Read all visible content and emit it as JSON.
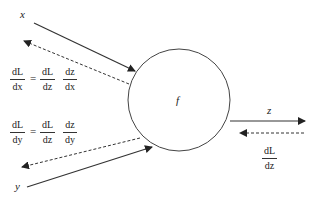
{
  "diagram": {
    "node": {
      "label": "f"
    },
    "inputs": [
      {
        "label": "x"
      },
      {
        "label": "y"
      }
    ],
    "output": {
      "label": "z"
    },
    "upstream_gradient": {
      "num": "dL",
      "den": "dz"
    },
    "chain_rule_x": {
      "lhs": {
        "num": "dL",
        "den": "dx"
      },
      "equals": "=",
      "rhs1": {
        "num": "dL",
        "den": "dz"
      },
      "rhs2": {
        "num": "dz",
        "den": "dx"
      }
    },
    "chain_rule_y": {
      "lhs": {
        "num": "dL",
        "den": "dy"
      },
      "equals": "=",
      "rhs1": {
        "num": "dL",
        "den": "dz"
      },
      "rhs2": {
        "num": "dz",
        "den": "dy"
      }
    },
    "colors": {
      "line": "#333333",
      "text": "#222222"
    }
  }
}
